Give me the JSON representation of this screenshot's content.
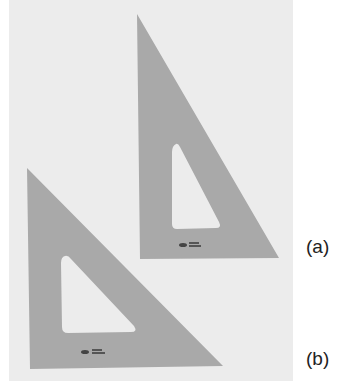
{
  "figure": {
    "background_color": "#ececec",
    "triangle_color": "#a9a9a9",
    "cutout_color": "#ececec",
    "items": [
      {
        "id": "a",
        "label": "(a)",
        "description": "30-60 degree drafting triangle",
        "outer": [
          [
            137,
            14
          ],
          [
            140,
            259
          ],
          [
            279,
            258
          ]
        ],
        "cutout": [
          [
            175,
            146
          ],
          [
            172,
            229
          ],
          [
            220,
            228
          ]
        ],
        "logo_position": [
          183,
          244
        ]
      },
      {
        "id": "b",
        "label": "(b)",
        "description": "45 degree drafting triangle",
        "outer": [
          [
            27,
            168
          ],
          [
            30,
            369
          ],
          [
            223,
            366
          ]
        ],
        "cutout": [
          [
            64,
            257
          ],
          [
            62,
            333
          ],
          [
            136,
            332
          ]
        ],
        "logo_position": [
          80,
          351
        ]
      }
    ]
  }
}
